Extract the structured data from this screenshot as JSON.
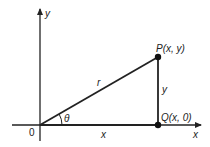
{
  "diagram": {
    "type": "right-triangle-polar-coordinates",
    "axes": {
      "x_label": "x",
      "y_label": "y",
      "origin_label": "0"
    },
    "points": {
      "P": {
        "label": "P(x, y)"
      },
      "Q": {
        "label": "Q(x, 0)"
      }
    },
    "segments": {
      "hypotenuse_label": "r",
      "vertical_label": "y",
      "horizontal_label": "x"
    },
    "angle_label": "θ",
    "colors": {
      "stroke": "#222222",
      "background": "#ffffff"
    }
  }
}
